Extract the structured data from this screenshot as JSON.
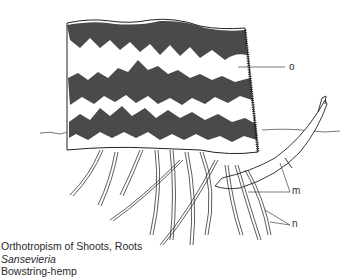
{
  "figure": {
    "labels": {
      "o": "o",
      "m": "m",
      "n": "n"
    },
    "caption": {
      "line1": "Orthotropism of Shoots, Roots",
      "line2": "Sansevieria",
      "line3": "Bowstring-hemp"
    }
  }
}
